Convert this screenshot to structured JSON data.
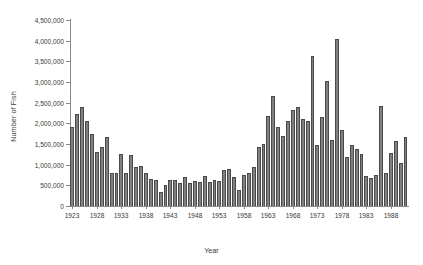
{
  "chart_data": {
    "type": "bar",
    "title": "",
    "xlabel": "Year",
    "ylabel": "Number of Fish",
    "ylim": [
      0,
      4500000
    ],
    "ytick_labels": [
      "0",
      "500,000",
      "1,000,000",
      "1,500,000",
      "2,000,000",
      "2,500,000",
      "3,000,000",
      "3,500,000",
      "4,000,000",
      "4,500,000"
    ],
    "ytick_values": [
      0,
      500000,
      1000000,
      1500000,
      2000000,
      2500000,
      3000000,
      3500000,
      4000000,
      4500000
    ],
    "xtick_labels": [
      "1923",
      "1928",
      "1933",
      "1938",
      "1943",
      "1948",
      "1953",
      "1958",
      "1963",
      "1968",
      "1973",
      "1978",
      "1983",
      "1988"
    ],
    "grid": false,
    "legend": "none",
    "bar_color": "#808080",
    "bar_edge_color": "#4a4a4a",
    "axis_color": "#8a8a8a",
    "categories": [
      1923,
      1924,
      1925,
      1926,
      1927,
      1928,
      1929,
      1930,
      1931,
      1932,
      1933,
      1934,
      1935,
      1936,
      1937,
      1938,
      1939,
      1940,
      1941,
      1942,
      1943,
      1944,
      1945,
      1946,
      1947,
      1948,
      1949,
      1950,
      1951,
      1952,
      1953,
      1954,
      1955,
      1956,
      1957,
      1958,
      1959,
      1960,
      1961,
      1962,
      1963,
      1964,
      1965,
      1966,
      1967,
      1968,
      1969,
      1970,
      1971,
      1972,
      1973,
      1974,
      1975,
      1976,
      1977,
      1978,
      1979,
      1980,
      1981,
      1982,
      1983,
      1984,
      1985,
      1986,
      1987,
      1988,
      1989,
      1990,
      1991
    ],
    "values": [
      1900000,
      2230000,
      2400000,
      2050000,
      1740000,
      1300000,
      1420000,
      1680000,
      800000,
      800000,
      1270000,
      800000,
      1230000,
      950000,
      980000,
      800000,
      650000,
      620000,
      330000,
      520000,
      620000,
      620000,
      560000,
      700000,
      560000,
      600000,
      580000,
      720000,
      580000,
      620000,
      600000,
      880000,
      900000,
      700000,
      380000,
      760000,
      800000,
      950000,
      1420000,
      1500000,
      2180000,
      2650000,
      1900000,
      1700000,
      2050000,
      2330000,
      2400000,
      2110000,
      2060000,
      3620000,
      1480000,
      2160000,
      3030000,
      1600000,
      4030000,
      1830000,
      1180000,
      1480000,
      1380000,
      1260000,
      720000,
      680000,
      760000,
      2420000,
      800000,
      1280000,
      1580000,
      1050000,
      1680000
    ]
  }
}
